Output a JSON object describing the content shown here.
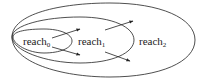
{
  "diagram": {
    "type": "nested-ellipses",
    "regions": [
      {
        "id": "reach0",
        "base": "reach",
        "subscript": "0"
      },
      {
        "id": "reach1",
        "base": "reach",
        "subscript": "1"
      },
      {
        "id": "reach2",
        "base": "reach",
        "subscript": "2"
      }
    ],
    "arrows": [
      {
        "from": "reach0",
        "to": "reach1"
      },
      {
        "from": "reach0",
        "to": "reach1"
      },
      {
        "from": "reach1",
        "to": "reach2"
      },
      {
        "from": "reach1",
        "to": "reach2"
      }
    ],
    "colors": {
      "stroke": "#222222",
      "background": "#ffffff"
    }
  }
}
